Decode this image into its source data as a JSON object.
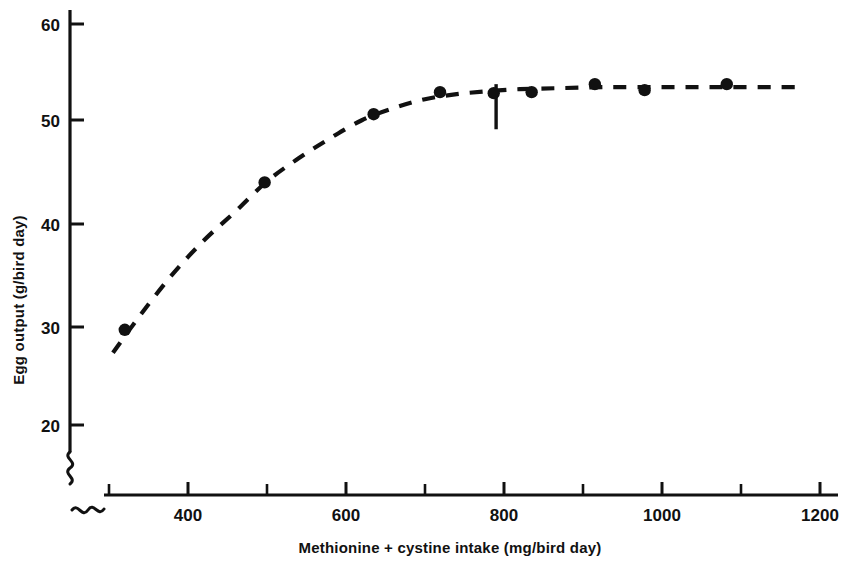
{
  "chart_data": {
    "type": "scatter",
    "title": "",
    "subtitle": "",
    "xlabel": "Methionine + cystine intake (mg/bird day)",
    "ylabel": "Egg output (g/bird day)",
    "xlim": [
      300,
      1220
    ],
    "ylim": [
      18,
      62
    ],
    "x_ticks_major": [
      400,
      600,
      800,
      1000,
      1200
    ],
    "x_tick_labels": [
      "400",
      "600",
      "800",
      "1000",
      "1200"
    ],
    "x_ticks_minor": [
      350,
      450,
      500,
      550,
      650,
      700,
      750,
      850,
      900,
      950,
      1050,
      1100,
      1150
    ],
    "y_ticks_major": [
      20,
      30,
      40,
      50,
      60
    ],
    "y_tick_labels": [
      "20",
      "30",
      "40",
      "50",
      "60"
    ],
    "grid": false,
    "legend": null,
    "axis_break_x": true,
    "axis_break_y": true,
    "series": [
      {
        "name": "Egg output response",
        "marker": "filled-circle",
        "line_style": "dashed",
        "x": [
          320,
          497,
          635,
          719,
          787,
          835,
          915,
          978,
          1082
        ],
        "y": [
          29.5,
          44.2,
          51.0,
          53.2,
          53.1,
          53.2,
          54.0,
          53.4,
          54.0
        ]
      }
    ],
    "fitted_curve": {
      "description": "dashed fitted response curve",
      "x": [
        305,
        340,
        380,
        420,
        460,
        500,
        540,
        580,
        620,
        660,
        700,
        740,
        780,
        820,
        870,
        930,
        1000,
        1070,
        1140,
        1180
      ],
      "y": [
        27.2,
        31.0,
        35.0,
        38.4,
        41.3,
        44.3,
        46.6,
        48.6,
        50.4,
        51.6,
        52.5,
        53.0,
        53.3,
        53.5,
        53.6,
        53.7,
        53.7,
        53.7,
        53.7,
        53.7
      ]
    },
    "annotations": [
      {
        "type": "vertical-marker",
        "name": "requirement-marker",
        "x": 790,
        "y_from": 49.5,
        "y_to": 54.0,
        "label": ""
      }
    ]
  },
  "axes": {
    "y_axis_name": "Egg output (g/bird day)",
    "x_axis_name": "Methionine + cystine intake (mg/bird day)"
  }
}
